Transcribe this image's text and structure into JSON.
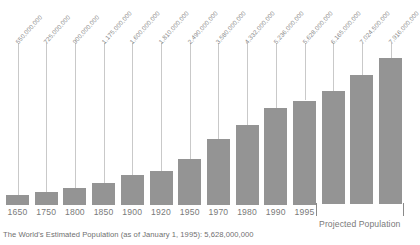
{
  "chart_data": {
    "type": "bar",
    "title": "",
    "xlabel": "",
    "ylabel": "",
    "grid": false,
    "legend": "none",
    "ylim": [
      0,
      7916000000
    ],
    "categories": [
      "1650",
      "1750",
      "1800",
      "1850",
      "1900",
      "1920",
      "1950",
      "1970",
      "1980",
      "1990",
      "1995",
      "2000",
      "2010",
      "2020"
    ],
    "values": [
      550000000,
      725000000,
      900000000,
      1175000000,
      1600000000,
      1810000000,
      2490000000,
      3580000000,
      4332000000,
      5236000000,
      5628000000,
      6165000000,
      7024500000,
      7916000000
    ],
    "value_labels": [
      "550,000,000",
      "725,000,000",
      "900,000,000",
      "1,175,000,000",
      "1,600,000,000",
      "1,810,000,000",
      "2,490,000,000",
      "3,580,000,000",
      "4,332,000,000",
      "5,236,000,000",
      "5,628,000,000",
      "6,165,000,000",
      "7,024,500,000",
      "7,916,000,000"
    ],
    "projected_from_index": 11,
    "annotations": [
      {
        "name": "projected-population",
        "text": "Projected Population"
      },
      {
        "name": "caption",
        "text": "The World's Estimated Population (as of January 1, 1995): 5,628,000,000"
      }
    ],
    "colors": {
      "bar": "#949494",
      "leader_line": "#c9c9c9",
      "value_label": "#8a8a8a",
      "year_label": "#7a7a7a",
      "caption": "#6f6f6f",
      "background": "#ffffff"
    }
  },
  "footer": {
    "caption": "The World's Estimated Population (as of January 1, 1995): 5,628,000,000"
  },
  "projected": {
    "label": "Projected Population"
  }
}
